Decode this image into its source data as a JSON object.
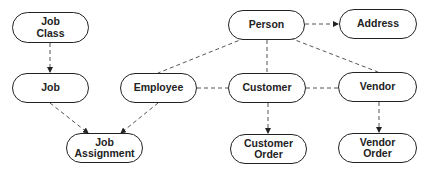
{
  "diagram": {
    "type": "entity-relationship",
    "nodes": [
      {
        "id": "job_class",
        "label": "Job\nClass",
        "x": 12,
        "y": 12,
        "w": 77,
        "h": 31
      },
      {
        "id": "job",
        "label": "Job",
        "x": 12,
        "y": 73,
        "w": 77,
        "h": 30
      },
      {
        "id": "employee",
        "label": "Employee",
        "x": 120,
        "y": 73,
        "w": 77,
        "h": 30
      },
      {
        "id": "person",
        "label": "Person",
        "x": 228,
        "y": 10,
        "w": 77,
        "h": 30
      },
      {
        "id": "address",
        "label": "Address",
        "x": 339,
        "y": 9,
        "w": 78,
        "h": 30
      },
      {
        "id": "customer",
        "label": "Customer",
        "x": 228,
        "y": 73,
        "w": 78,
        "h": 30
      },
      {
        "id": "vendor",
        "label": "Vendor",
        "x": 338,
        "y": 72,
        "w": 79,
        "h": 30
      },
      {
        "id": "job_assignment",
        "label": "Job\nAssignment",
        "x": 66,
        "y": 133,
        "w": 77,
        "h": 30
      },
      {
        "id": "customer_order",
        "label": "Customer\nOrder",
        "x": 230,
        "y": 134,
        "w": 77,
        "h": 30
      },
      {
        "id": "vendor_order",
        "label": "Vendor\nOrder",
        "x": 338,
        "y": 133,
        "w": 79,
        "h": 30
      }
    ],
    "edges": [
      {
        "from": "job_class",
        "to": "job",
        "arrow": true
      },
      {
        "from": "job",
        "to": "job_assignment",
        "arrow": true
      },
      {
        "from": "employee",
        "to": "job_assignment",
        "arrow": true
      },
      {
        "from": "person",
        "to": "address",
        "arrow": true
      },
      {
        "from": "person",
        "to": "employee",
        "arrow": false
      },
      {
        "from": "person",
        "to": "customer",
        "arrow": false
      },
      {
        "from": "person",
        "to": "vendor",
        "arrow": false
      },
      {
        "from": "employee",
        "to": "customer",
        "arrow": false
      },
      {
        "from": "customer",
        "to": "vendor",
        "arrow": false
      },
      {
        "from": "customer",
        "to": "customer_order",
        "arrow": true
      },
      {
        "from": "vendor",
        "to": "vendor_order",
        "arrow": true
      }
    ],
    "style": {
      "stroke": "#222222",
      "edge_color": "#555555",
      "dash": "4,3"
    }
  }
}
